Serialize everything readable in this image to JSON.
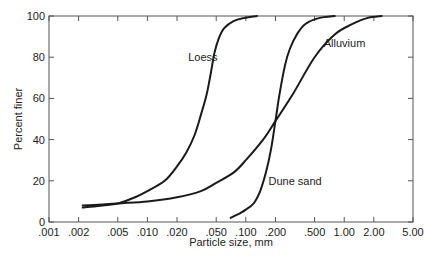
{
  "chart_data": {
    "type": "line",
    "title": "",
    "xlabel": "Particle size, mm",
    "ylabel": "Percent finer",
    "xscale": "log",
    "xlim": [
      0.001,
      5.0
    ],
    "ylim": [
      0,
      100
    ],
    "grid": false,
    "legend": "inline labels",
    "x_ticks": [
      0.001,
      0.002,
      0.005,
      0.01,
      0.02,
      0.05,
      0.1,
      0.2,
      0.5,
      1.0,
      2.0,
      5.0
    ],
    "x_tick_labels": [
      ".001",
      ".002",
      ".005",
      ".010",
      ".020",
      ".050",
      ".100",
      ".200",
      ".500",
      "1.00",
      "2.00",
      "5.00"
    ],
    "y_ticks": [
      0,
      20,
      40,
      60,
      80,
      100
    ],
    "y_tick_labels": [
      "0",
      "20",
      "40",
      "60",
      "80",
      "100"
    ],
    "series": [
      {
        "name": "Loess",
        "label_pos": [
          0.026,
          78
        ],
        "x": [
          0.0022,
          0.0035,
          0.005,
          0.0075,
          0.01,
          0.015,
          0.02,
          0.025,
          0.03,
          0.035,
          0.04,
          0.044,
          0.048,
          0.053,
          0.06,
          0.075,
          0.095,
          0.13
        ],
        "y": [
          7,
          8,
          9,
          12,
          15,
          20,
          27,
          34,
          42,
          52,
          62,
          72,
          82,
          89,
          94,
          97.5,
          99,
          100
        ]
      },
      {
        "name": "Alluvium",
        "label_pos": [
          0.62,
          85
        ],
        "x": [
          0.0022,
          0.0035,
          0.005,
          0.01,
          0.02,
          0.035,
          0.05,
          0.075,
          0.1,
          0.15,
          0.2,
          0.3,
          0.5,
          0.8,
          1.2,
          1.7,
          2.4
        ],
        "y": [
          8,
          8.5,
          9,
          10,
          12,
          15,
          19,
          24,
          30,
          40,
          49,
          62,
          80,
          91,
          96,
          99,
          100
        ]
      },
      {
        "name": "Dune sand",
        "label_pos": [
          0.17,
          18
        ],
        "x": [
          0.07,
          0.085,
          0.1,
          0.12,
          0.14,
          0.16,
          0.18,
          0.2,
          0.22,
          0.25,
          0.28,
          0.33,
          0.4,
          0.55,
          0.8
        ],
        "y": [
          2,
          4,
          6,
          9,
          15,
          24,
          35,
          49,
          62,
          76,
          84,
          91,
          96,
          99,
          100
        ]
      }
    ]
  }
}
